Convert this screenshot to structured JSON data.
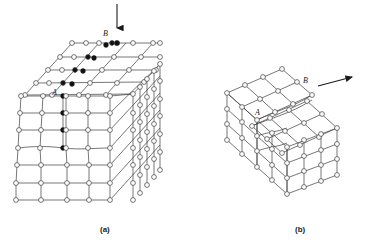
{
  "figure": {
    "type": "crystal-dislocation-diagram",
    "background_color": "#ffffff",
    "line_color": "#3c3c3c",
    "atom_open_fill": "#ffffff",
    "atom_filled_fill": "#111111",
    "arrow_color": "#1a1a1a",
    "label_color": "#1a1a1a"
  },
  "panels": [
    {
      "id": "a",
      "caption": "(a)",
      "caption_x": 100,
      "caption_y": 225,
      "title": "edge dislocation",
      "arrow": {
        "name": "load-arrow-down",
        "direction": "down",
        "x1": 117,
        "y1": 4,
        "x2": 117,
        "y2": 32
      },
      "labels": [
        {
          "text": "B",
          "x": 106,
          "y": 33,
          "name": "label-b"
        },
        {
          "text": "A",
          "x": 55,
          "y": 92,
          "name": "label-a"
        }
      ],
      "lattice": {
        "top_face_cols": 5,
        "top_face_rows": 4,
        "front_face_cols": 4,
        "front_face_rows": 6,
        "side_face_cols": 5,
        "side_face_rows": 6,
        "extra_half_plane_atoms": 9
      }
    },
    {
      "id": "b",
      "caption": "(b)",
      "caption_x": 295,
      "caption_y": 225,
      "title": "screw dislocation",
      "arrow": {
        "name": "shear-arrow-upright",
        "direction": "up-right",
        "x1": 320,
        "y1": 86,
        "x2": 357,
        "y2": 76
      },
      "labels": [
        {
          "text": "B",
          "x": 306,
          "y": 80,
          "name": "label-b"
        },
        {
          "text": "A",
          "x": 257,
          "y": 112,
          "name": "label-a"
        }
      ],
      "lattice": {
        "top_face_cols": 4,
        "top_face_rows": 3,
        "front_face_cols": 4,
        "front_face_rows": 3,
        "side_face_cols": 3,
        "side_face_rows": 3,
        "step_present": true
      }
    }
  ]
}
